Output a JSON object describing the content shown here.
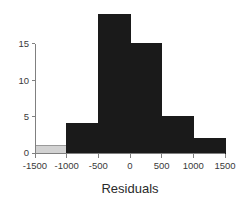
{
  "chart_data": {
    "type": "bar",
    "title": "",
    "subtitle": "",
    "xlabel": "Residuals",
    "ylabel": "",
    "grid": false,
    "legend": null,
    "legend_position": "none",
    "xlim": [
      -1500,
      1500
    ],
    "ylim": [
      0,
      19
    ],
    "bin_width": 500,
    "x_ticks": [
      -1500,
      -1000,
      -500,
      0,
      500,
      1000,
      1500
    ],
    "x_tick_labels": [
      "-1500",
      "-1000",
      "-500",
      "0",
      "500",
      "1000",
      "1500"
    ],
    "y_ticks": [
      0,
      5,
      10,
      15
    ],
    "y_tick_labels": [
      "0",
      "5",
      "10",
      "15"
    ],
    "categories": [
      "-1500 to -1000",
      "-1000 to -500",
      "-500 to 0",
      "0 to 500",
      "500 to 1000",
      "1000 to 1500"
    ],
    "bins": [
      {
        "start": -1500,
        "end": -1000,
        "count": 1,
        "color": "#d2d2d2"
      },
      {
        "start": -1000,
        "end": -500,
        "count": 4,
        "color": "#1a1a1a"
      },
      {
        "start": -500,
        "end": 0,
        "count": 19,
        "color": "#1a1a1a"
      },
      {
        "start": 0,
        "end": 500,
        "count": 15,
        "color": "#1a1a1a"
      },
      {
        "start": 500,
        "end": 1000,
        "count": 5,
        "color": "#1a1a1a"
      },
      {
        "start": 1000,
        "end": 1500,
        "count": 2,
        "color": "#1a1a1a"
      }
    ],
    "values": [
      1,
      4,
      19,
      15,
      5,
      2
    ]
  },
  "style": {
    "bar_color": "#1a1a1a",
    "highlight_bar_color": "#d2d2d2",
    "bar_border_color": "#9a9a9a",
    "axis_color": "#808080",
    "text_color": "#2a2a2a",
    "background": "#ffffff"
  },
  "geometry": {
    "x_axis_pixel_start": 35,
    "x_axis_pixel_end": 225,
    "y_zero_pixel": 153,
    "y_pixels_per_unit": 7.27
  }
}
